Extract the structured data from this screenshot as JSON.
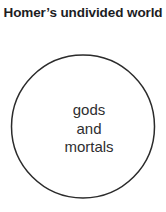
{
  "figure": {
    "title_line1": "Homer’s undivided",
    "title_line2": "world",
    "title_full": "Homer’s undivided world",
    "background_color": "#ffffff",
    "title_color": "#1d1d1f"
  },
  "diagram": {
    "type": "venn-single-set",
    "shape": "circle",
    "stroke_color": "#2b2b2b",
    "fill_color": "none",
    "stroke_width": 1.5,
    "center_x": 83,
    "center_y": 126.5,
    "radius": 71.5,
    "label_color": "#2e2e30",
    "label_lines": [
      "gods",
      "and",
      "mortals"
    ],
    "label_text": "gods and mortals"
  }
}
